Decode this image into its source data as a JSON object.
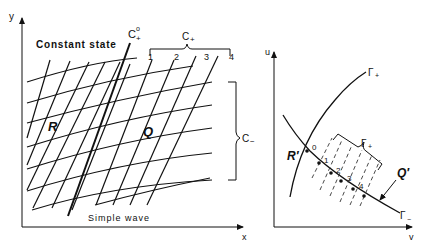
{
  "left_diagram": {
    "axis_x_label": "x",
    "axis_y_label": "y",
    "region_top_label": "Constant state",
    "region_bottom_label": "Simple wave",
    "region_R_label": "R",
    "region_Q_label": "Q",
    "c_plus_zero_label": "C",
    "c_plus_zero_sup": "o",
    "c_plus_zero_sub": "+",
    "c_plus_group_label": "C",
    "c_plus_group_sub": "+",
    "c_minus_group_label": "C",
    "c_minus_group_sub": "−",
    "c_plus_numbers": [
      "1",
      "2",
      "3",
      "4"
    ]
  },
  "right_diagram": {
    "axis_u_label": "u",
    "axis_v_label": "v",
    "gamma_plus_curve_label": "Γ",
    "gamma_plus_curve_sub": "+",
    "gamma_minus_curve_label": "Γ",
    "gamma_minus_curve_sub": "−",
    "gamma_plus_group_label": "Γ",
    "gamma_plus_group_sub": "+",
    "region_R_prime_label": "R′",
    "region_Q_prime_label": "Q′",
    "point_numbers": [
      "0",
      "1",
      "2",
      "3",
      "4"
    ]
  },
  "colors": {
    "ink": "#111111",
    "background": "#ffffff"
  }
}
